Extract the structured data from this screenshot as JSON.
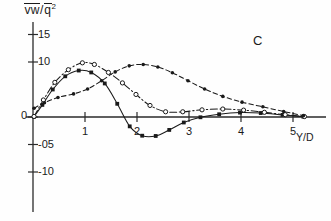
{
  "figure": {
    "panel_label": "C",
    "ylabel": "vw/q²",
    "ylabel_parts": {
      "num": "vw",
      "slash": "/",
      "den": "q",
      "exp": "2"
    },
    "xlabel": "Y/D"
  },
  "chart_data": {
    "type": "line",
    "title": "",
    "subtitle": "",
    "panel_label": "C",
    "xlabel": "Y/D",
    "ylabel": "vw/q²",
    "xlim": [
      -0.15,
      5.55
    ],
    "ylim": [
      -1.35,
      1.85
    ],
    "grid": false,
    "legend": "none",
    "y_tick_values": [
      15,
      10,
      0,
      -5,
      -10
    ],
    "y_tick_labels": [
      "15",
      "10",
      "0",
      "-05",
      "-10"
    ],
    "y_tick_scaled": [
      1.5,
      1.0,
      0.0,
      -0.5,
      -1.0
    ],
    "x_tick_values": [
      1,
      2,
      3,
      4,
      5
    ],
    "x_tick_labels": [
      "1",
      "2",
      "3",
      "4",
      "5"
    ],
    "value_scale_note": "tick labels 15/10/05 denote 1.5/1.0/0.5 of plotted quantity x10",
    "series": [
      {
        "name": "solid-square",
        "line_style": "solid",
        "marker": "filled-square",
        "color": "#1a1a1a",
        "x": [
          0.02,
          0.18,
          0.38,
          0.62,
          0.88,
          1.12,
          1.38,
          1.62,
          1.86,
          2.1,
          2.36,
          2.62,
          2.9,
          3.22,
          3.58,
          3.98,
          4.38,
          4.8,
          5.2
        ],
        "y": [
          0.05,
          2.2,
          5.0,
          7.4,
          8.45,
          8.1,
          6.1,
          2.4,
          -1.7,
          -3.4,
          -3.45,
          -2.35,
          -1.0,
          -0.05,
          0.5,
          0.8,
          0.72,
          0.38,
          0.05
        ]
      },
      {
        "name": "dashdot-circle",
        "line_style": "dashdot",
        "marker": "open-circle",
        "color": "#1a1a1a",
        "x": [
          0.02,
          0.2,
          0.42,
          0.68,
          0.95,
          1.18,
          1.45,
          1.72,
          1.98,
          2.25,
          2.55,
          2.88,
          3.25,
          3.65,
          4.05,
          4.45,
          4.85,
          5.22
        ],
        "y": [
          0.1,
          3.1,
          6.3,
          8.6,
          9.85,
          9.55,
          8.1,
          6.2,
          4.1,
          2.1,
          0.95,
          0.95,
          1.3,
          1.45,
          1.25,
          0.85,
          0.42,
          0.08
        ]
      },
      {
        "name": "dashed-dot",
        "line_style": "dashed",
        "marker": "filled-dot",
        "color": "#1a1a1a",
        "x": [
          0.02,
          0.22,
          0.48,
          0.78,
          1.05,
          1.32,
          1.58,
          1.85,
          2.12,
          2.4,
          2.68,
          2.98,
          3.3,
          3.65,
          4.02,
          4.42,
          4.82,
          5.2
        ],
        "y": [
          1.6,
          2.6,
          3.55,
          4.2,
          5.1,
          6.6,
          8.2,
          9.3,
          9.55,
          9.1,
          8.05,
          6.6,
          5.1,
          3.75,
          2.7,
          1.85,
          1.0,
          0.25
        ]
      }
    ]
  }
}
